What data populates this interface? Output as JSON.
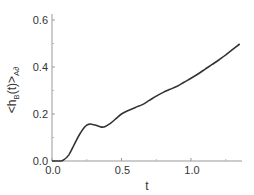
{
  "chart_data": {
    "type": "line",
    "title": "",
    "xlabel": "t",
    "ylabel": "<h_B(t)>_{A∂}",
    "xlim": [
      0.0,
      1.35
    ],
    "ylim": [
      0.0,
      0.65
    ],
    "xticks": [
      0.0,
      0.5,
      1.0
    ],
    "xtick_labels": [
      "0.0",
      "0.5",
      "1.0"
    ],
    "yticks": [
      0.0,
      0.2,
      0.4,
      0.6
    ],
    "ytick_labels": [
      "0.0",
      "0.2",
      "0.4",
      "0.6"
    ],
    "grid": false,
    "legend": null,
    "series": [
      {
        "name": "<h_B(t)>",
        "color": "#333333",
        "x": [
          0.0,
          0.05,
          0.08,
          0.12,
          0.16,
          0.2,
          0.24,
          0.27,
          0.31,
          0.35,
          0.38,
          0.42,
          0.46,
          0.5,
          0.55,
          0.6,
          0.65,
          0.7,
          0.75,
          0.8,
          0.85,
          0.9,
          0.95,
          1.0,
          1.05,
          1.1,
          1.15,
          1.2,
          1.25,
          1.3,
          1.35
        ],
        "y": [
          0.0,
          0.0,
          0.003,
          0.025,
          0.07,
          0.115,
          0.148,
          0.157,
          0.153,
          0.145,
          0.146,
          0.16,
          0.18,
          0.2,
          0.215,
          0.228,
          0.24,
          0.258,
          0.276,
          0.292,
          0.305,
          0.318,
          0.335,
          0.352,
          0.37,
          0.39,
          0.41,
          0.43,
          0.452,
          0.475,
          0.498
        ]
      }
    ]
  },
  "labels": {
    "x_axis": "t",
    "y_axis_main": "<h",
    "y_axis_sub": "B",
    "y_axis_mid": "(t)>",
    "y_axis_sub2": "A∂",
    "xticks": [
      "0.0",
      "0.5",
      "1.0"
    ],
    "yticks": [
      "0.0",
      "0.2",
      "0.4",
      "0.6"
    ]
  }
}
